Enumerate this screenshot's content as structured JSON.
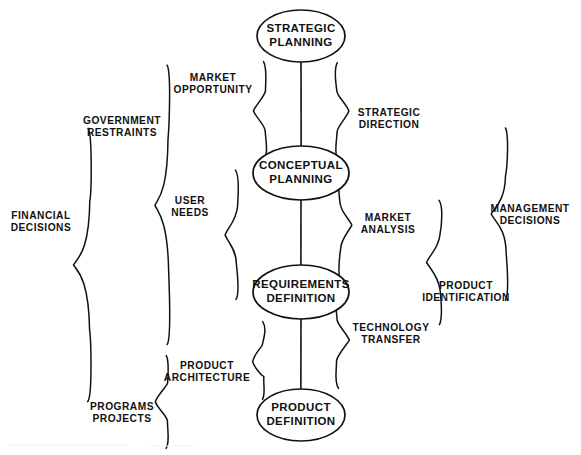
{
  "diagram": {
    "background_color": "#ffffff",
    "ink_color": "#111111",
    "nodes": [
      {
        "id": "strategic-planning",
        "line1": "STRATEGIC",
        "line2": "PLANNING",
        "cx": 301,
        "cy": 36,
        "rx": 44,
        "ry": 26
      },
      {
        "id": "conceptual-planning",
        "line1": "CONCEPTUAL",
        "line2": "PLANNING",
        "cx": 301,
        "cy": 173,
        "rx": 48,
        "ry": 27
      },
      {
        "id": "requirements-definition",
        "line1": "REQUIREMENTS",
        "line2": "DEFINITION",
        "cx": 301,
        "cy": 292,
        "rx": 48,
        "ry": 27
      },
      {
        "id": "product-definition",
        "line1": "PRODUCT",
        "line2": "DEFINITION",
        "cx": 301,
        "cy": 415,
        "rx": 44,
        "ry": 26
      }
    ],
    "connectors": [
      {
        "id": "strategic-to-conceptual",
        "x": 301,
        "y1": 62,
        "y2": 146
      },
      {
        "id": "conceptual-to-requirements",
        "x": 301,
        "y1": 200,
        "y2": 265
      },
      {
        "id": "requirements-to-product",
        "x": 301,
        "y1": 319,
        "y2": 389
      }
    ],
    "braces": [
      {
        "id": "market-opportunity",
        "label_line1": "MARKET",
        "label_line2": "OPPORTUNITY",
        "label_x": 213,
        "label_y": 84,
        "orientation": "opens-right",
        "x": 253,
        "y_top": 62,
        "y_bottom": 160,
        "depth": 13
      },
      {
        "id": "government-restraints",
        "label_line1": "GOVERNMENT",
        "label_line2": "RESTRAINTS",
        "label_x": 122,
        "label_y": 127,
        "orientation": "opens-right",
        "x": 155,
        "y_top": 66,
        "y_bottom": 345,
        "depth": 14
      },
      {
        "id": "financial-decisions",
        "label_line1": "FINANCIAL",
        "label_line2": "DECISIONS",
        "label_x": 41,
        "label_y": 222,
        "orientation": "opens-right",
        "x": 74,
        "y_top": 128,
        "y_bottom": 402,
        "depth": 17
      },
      {
        "id": "user-needs",
        "label_line1": "USER",
        "label_line2": "NEEDS",
        "label_x": 190,
        "label_y": 207,
        "orientation": "opens-right",
        "x": 225,
        "y_top": 170,
        "y_bottom": 300,
        "depth": 13
      },
      {
        "id": "product-architecture",
        "label_line1": "PRODUCT",
        "label_line2": "ARCHITECTURE",
        "label_x": 207,
        "label_y": 372,
        "orientation": "opens-right",
        "x": 252,
        "y_top": 322,
        "y_bottom": 400,
        "depth": 12
      },
      {
        "id": "programs-projects",
        "label_line1": "PROGRAMS",
        "label_line2": "PROJECTS",
        "label_x": 122,
        "label_y": 413,
        "orientation": "opens-right",
        "x": 155,
        "y_top": 355,
        "y_bottom": 448,
        "depth": 13
      },
      {
        "id": "strategic-direction",
        "label_line1": "STRATEGIC",
        "label_line2": "DIRECTION",
        "label_x": 389,
        "label_y": 119,
        "orientation": "opens-left",
        "x": 349,
        "y_top": 62,
        "y_bottom": 160,
        "depth": 13
      },
      {
        "id": "market-analysis",
        "label_line1": "MARKET",
        "label_line2": "ANALYSIS",
        "label_x": 388,
        "label_y": 224,
        "orientation": "opens-left",
        "x": 352,
        "y_top": 172,
        "y_bottom": 280,
        "depth": 13
      },
      {
        "id": "technology-transfer",
        "label_line1": "TECHNOLOGY",
        "label_line2": "TRANSFER",
        "label_x": 391,
        "label_y": 334,
        "orientation": "opens-left",
        "x": 349,
        "y_top": 292,
        "y_bottom": 388,
        "depth": 13
      },
      {
        "id": "product-identification",
        "label_line1": "PRODUCT",
        "label_line2": "IDENTIFICATION",
        "label_x": 466,
        "label_y": 292,
        "orientation": "opens-right",
        "x": 427,
        "y_top": 200,
        "y_bottom": 325,
        "depth": 14
      },
      {
        "id": "management-decisions",
        "label_line1": "MANAGEMENT",
        "label_line2": "DECISIONS",
        "label_x": 530,
        "label_y": 215,
        "orientation": "opens-right",
        "x": 492,
        "y_top": 128,
        "y_bottom": 300,
        "depth": 15
      }
    ]
  }
}
